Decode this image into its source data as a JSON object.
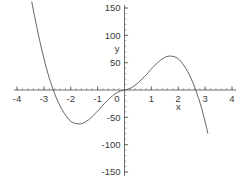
{
  "chart_data": {
    "type": "line",
    "title": "",
    "subtitle": "",
    "xlabel": "x",
    "ylabel": "y",
    "xlim": [
      -4,
      4
    ],
    "ylim": [
      -150,
      150
    ],
    "grid": false,
    "legend": false,
    "legend_position": "none",
    "x_major_ticks": [
      -4,
      -3,
      -2,
      -1,
      0,
      1,
      2,
      3,
      4
    ],
    "x_tick_labels": [
      "-4",
      "-3",
      "-2",
      "-1",
      "0",
      "1",
      "2",
      "3",
      "4"
    ],
    "x_minor_tick_step": 0.2,
    "y_major_ticks": [
      -150,
      -100,
      -50,
      0,
      50,
      100,
      150
    ],
    "y_tick_labels": [
      "-150",
      "-100",
      "-50",
      "0",
      "50",
      "100",
      "150"
    ],
    "y_minor_tick_step": 10,
    "axis_position": "zero-crossing",
    "curve_color": "#555555",
    "axis_color": "#4a4a4a",
    "annotations": [],
    "series": [
      {
        "name": "curve",
        "note": "odd-symmetric quintic-like curve through origin",
        "x": [
          -3.45,
          -3.35,
          -3.25,
          -3.15,
          -3.05,
          -2.95,
          -2.85,
          -2.75,
          -2.65,
          -2.55,
          -2.45,
          -2.35,
          -2.25,
          -2.15,
          -2.05,
          -1.95,
          -1.85,
          -1.75,
          -1.65,
          -1.55,
          -1.45,
          -1.35,
          -1.25,
          -1.15,
          -1.05,
          -0.95,
          -0.85,
          -0.75,
          -0.65,
          -0.55,
          -0.45,
          -0.35,
          -0.25,
          -0.15,
          -0.05,
          0,
          0.05,
          0.15,
          0.25,
          0.35,
          0.45,
          0.55,
          0.65,
          0.75,
          0.85,
          0.95,
          1.05,
          1.15,
          1.25,
          1.35,
          1.45,
          1.55,
          1.65,
          1.75,
          1.85,
          1.95,
          2.05,
          2.15,
          2.25,
          2.35,
          2.45,
          2.55,
          2.65,
          2.75,
          2.85,
          2.95,
          3.05,
          3.1
        ],
        "y": [
          161,
          136,
          112,
          89,
          68,
          48,
          30,
          14,
          0,
          -13,
          -24,
          -34,
          -42,
          -49,
          -55,
          -59,
          -61,
          -62,
          -62,
          -61,
          -58,
          -55,
          -51,
          -46,
          -41,
          -36,
          -30,
          -25,
          -20,
          -15,
          -11,
          -7,
          -4,
          -2,
          -0.4,
          0,
          0.4,
          2,
          4,
          7,
          11,
          15,
          20,
          25,
          30,
          36,
          41,
          46,
          51,
          55,
          58,
          61,
          62,
          62,
          61,
          59,
          55,
          49,
          42,
          34,
          24,
          13,
          0,
          -14,
          -30,
          -48,
          -68,
          -79
        ]
      }
    ]
  }
}
